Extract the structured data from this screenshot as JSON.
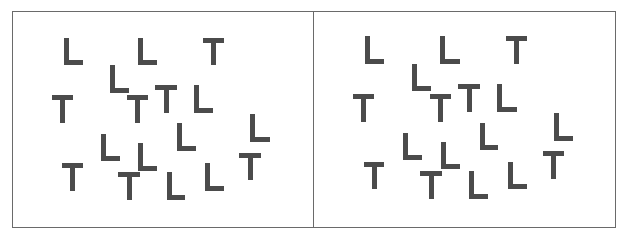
{
  "figure": {
    "colors": {
      "letter": "#4b4b4b",
      "border": "#6a6a6a",
      "background": "#ffffff"
    },
    "panels": [
      {
        "name": "left",
        "items": [
          {
            "letter": "L",
            "x": 51,
            "y": 26,
            "w": 19,
            "h": 27
          },
          {
            "letter": "L",
            "x": 125,
            "y": 26,
            "w": 19,
            "h": 27
          },
          {
            "letter": "T",
            "x": 190,
            "y": 26,
            "w": 21,
            "h": 27
          },
          {
            "letter": "L",
            "x": 97,
            "y": 53,
            "w": 19,
            "h": 28
          },
          {
            "letter": "T",
            "x": 39,
            "y": 83,
            "w": 21,
            "h": 28
          },
          {
            "letter": "T",
            "x": 114,
            "y": 83,
            "w": 21,
            "h": 28
          },
          {
            "letter": "T",
            "x": 142,
            "y": 73,
            "w": 22,
            "h": 28
          },
          {
            "letter": "L",
            "x": 181,
            "y": 73,
            "w": 19,
            "h": 28
          },
          {
            "letter": "L",
            "x": 237,
            "y": 102,
            "w": 20,
            "h": 28
          },
          {
            "letter": "L",
            "x": 164,
            "y": 111,
            "w": 19,
            "h": 28
          },
          {
            "letter": "L",
            "x": 88,
            "y": 122,
            "w": 19,
            "h": 27
          },
          {
            "letter": "L",
            "x": 125,
            "y": 131,
            "w": 19,
            "h": 28
          },
          {
            "letter": "T",
            "x": 49,
            "y": 151,
            "w": 21,
            "h": 28
          },
          {
            "letter": "T",
            "x": 105,
            "y": 160,
            "w": 22,
            "h": 28
          },
          {
            "letter": "L",
            "x": 154,
            "y": 160,
            "w": 18,
            "h": 28
          },
          {
            "letter": "L",
            "x": 192,
            "y": 151,
            "w": 19,
            "h": 28
          },
          {
            "letter": "T",
            "x": 226,
            "y": 141,
            "w": 22,
            "h": 27
          }
        ]
      },
      {
        "name": "right",
        "items": [
          {
            "letter": "L",
            "x": 51,
            "y": 24,
            "w": 19,
            "h": 28
          },
          {
            "letter": "L",
            "x": 126,
            "y": 24,
            "w": 20,
            "h": 28
          },
          {
            "letter": "T",
            "x": 192,
            "y": 24,
            "w": 21,
            "h": 28
          },
          {
            "letter": "L",
            "x": 98,
            "y": 52,
            "w": 19,
            "h": 27
          },
          {
            "letter": "T",
            "x": 39,
            "y": 82,
            "w": 21,
            "h": 28
          },
          {
            "letter": "T",
            "x": 116,
            "y": 82,
            "w": 21,
            "h": 28
          },
          {
            "letter": "T",
            "x": 144,
            "y": 72,
            "w": 22,
            "h": 28
          },
          {
            "letter": "L",
            "x": 183,
            "y": 72,
            "w": 20,
            "h": 28
          },
          {
            "letter": "L",
            "x": 240,
            "y": 101,
            "w": 19,
            "h": 28
          },
          {
            "letter": "L",
            "x": 166,
            "y": 111,
            "w": 18,
            "h": 27
          },
          {
            "letter": "L",
            "x": 89,
            "y": 121,
            "w": 19,
            "h": 27
          },
          {
            "letter": "L",
            "x": 127,
            "y": 130,
            "w": 19,
            "h": 27
          },
          {
            "letter": "T",
            "x": 50,
            "y": 150,
            "w": 20,
            "h": 27
          },
          {
            "letter": "T",
            "x": 106,
            "y": 159,
            "w": 22,
            "h": 28
          },
          {
            "letter": "L",
            "x": 155,
            "y": 159,
            "w": 19,
            "h": 28
          },
          {
            "letter": "L",
            "x": 194,
            "y": 150,
            "w": 19,
            "h": 27
          },
          {
            "letter": "T",
            "x": 229,
            "y": 139,
            "w": 21,
            "h": 28
          }
        ]
      }
    ]
  }
}
